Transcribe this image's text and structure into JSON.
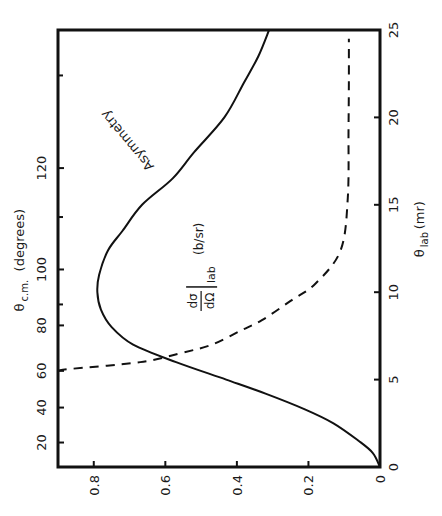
{
  "chart_data": {
    "type": "line",
    "orientation": "rotated 90 degrees counter-clockwise",
    "title": "",
    "xlabel": "θ_lab (mr)",
    "xlabel_main": "θ",
    "xlabel_sub": "lab",
    "xlabel_unit": "(mr)",
    "xlim": [
      0,
      25
    ],
    "xticks": [
      0,
      5,
      10,
      15,
      20,
      25
    ],
    "ylabel": "",
    "ylim": [
      0,
      0.9
    ],
    "yticks": [
      0,
      0.2,
      0.4,
      0.6,
      0.8
    ],
    "ytick_labels": [
      "0",
      "0.2",
      "0.4",
      "0.6",
      "0.8"
    ],
    "secondary_x_axis": {
      "label_main": "θ",
      "label_sub": "c.m.",
      "label_unit": "(degrees)",
      "position": "top",
      "ticks": [
        {
          "value": 20,
          "at_lab_mr": 1.4
        },
        {
          "value": 40,
          "at_lab_mr": 3.4
        },
        {
          "value": 60,
          "at_lab_mr": 5.5
        },
        {
          "value": 80,
          "at_lab_mr": 8.1
        },
        {
          "value": 100,
          "at_lab_mr": 11.3
        },
        {
          "value": 120,
          "at_lab_mr": 17.1
        }
      ],
      "minor_ticks_at_lab_mr": [
        9.3,
        14.3,
        22.4
      ]
    },
    "series": [
      {
        "name": "Asymmetry",
        "style": "solid",
        "x": [
          0,
          0.8,
          1.5,
          2.5,
          3.3,
          4.2,
          5,
          6,
          7,
          8,
          9,
          10,
          11,
          12.4,
          13.5,
          15,
          16.5,
          18,
          20,
          22,
          23.5,
          25
        ],
        "y": [
          0,
          0.02,
          0.06,
          0.13,
          0.21,
          0.32,
          0.43,
          0.57,
          0.69,
          0.75,
          0.78,
          0.79,
          0.785,
          0.76,
          0.72,
          0.665,
          0.58,
          0.52,
          0.435,
          0.38,
          0.34,
          0.31
        ]
      },
      {
        "name": "dσ/dΩ|lab (b/sr)",
        "style": "dashed",
        "x": [
          5.5,
          5.6,
          6.0,
          6.5,
          7.0,
          7.8,
          8.4,
          9.5,
          10.5,
          12.4,
          15.4,
          19.3,
          22,
          24.5
        ],
        "y": [
          0.9,
          0.87,
          0.67,
          0.56,
          0.47,
          0.39,
          0.33,
          0.25,
          0.18,
          0.11,
          0.09,
          0.088,
          0.087,
          0.087
        ]
      }
    ],
    "annotations": [
      {
        "text": "Asymmetry",
        "near_x": 17,
        "near_y": 0.6
      },
      {
        "text": "dσ/dΩ",
        "subscript": "lab",
        "unit": "(b/sr)",
        "near_x": 9.5,
        "near_y": 0.5
      }
    ],
    "grid": false,
    "legend": "none"
  }
}
